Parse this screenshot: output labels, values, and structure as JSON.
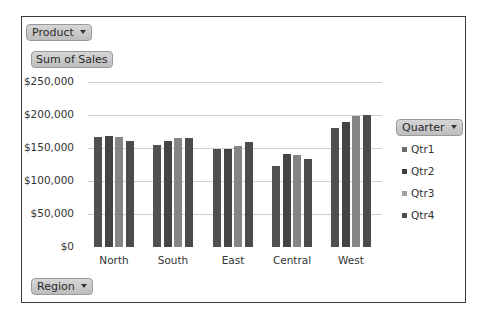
{
  "pivot_chart": {
    "filter_button": "Product",
    "value_button": "Sum of Sales",
    "legend_button": "Quarter",
    "axis_button": "Region"
  },
  "chart_data": {
    "type": "bar",
    "title": "",
    "xlabel": "",
    "ylabel": "Sum of Sales",
    "categories": [
      "North",
      "South",
      "East",
      "Central",
      "West"
    ],
    "series": [
      {
        "name": "Qtr1",
        "values": [
          167000,
          154000,
          148000,
          122000,
          181000
        ],
        "color": "#505050"
      },
      {
        "name": "Qtr2",
        "values": [
          168000,
          160000,
          149000,
          141000,
          189000
        ],
        "color": "#444444"
      },
      {
        "name": "Qtr3",
        "values": [
          167000,
          165000,
          153000,
          139000,
          198000
        ],
        "color": "#858585"
      },
      {
        "name": "Qtr4",
        "values": [
          161000,
          165000,
          159000,
          133000,
          200000
        ],
        "color": "#4b4b4b"
      }
    ],
    "ylim": [
      0,
      250000
    ],
    "yticks": [
      "$0",
      "$50,000",
      "$100,000",
      "$150,000",
      "$200,000",
      "$250,000"
    ],
    "ytick_values": [
      0,
      50000,
      100000,
      150000,
      200000,
      250000
    ],
    "grid": true,
    "legend_position": "right",
    "legend_title": "Quarter"
  }
}
